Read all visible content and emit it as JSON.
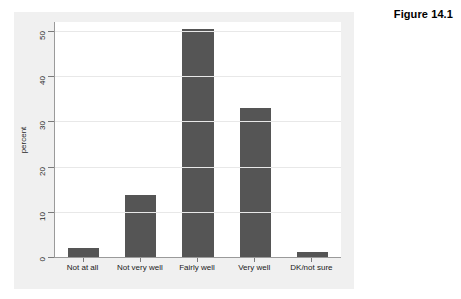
{
  "figure": {
    "caption": "Figure 14.1"
  },
  "chart_data": {
    "type": "bar",
    "title": "",
    "xlabel": "",
    "ylabel": "percent",
    "categories": [
      "Not at all",
      "Not very well",
      "Fairly well",
      "Very well",
      "DK/not sure"
    ],
    "values": [
      2.0,
      13.7,
      50.5,
      33.0,
      1.0
    ],
    "ylim": [
      0,
      52
    ],
    "yticks": [
      0,
      10,
      20,
      30,
      40,
      50
    ],
    "ytick_labels": [
      "0",
      "10",
      "20",
      "30",
      "40",
      "50"
    ],
    "grid": true,
    "grid_axis": "y",
    "legend": "none",
    "bar_color": "#555555",
    "plot_background": "#ffffff",
    "frame_background": "#f0f0f0",
    "gridline_color": "#e8e8e8",
    "axis_color": "#9a9a9a"
  }
}
